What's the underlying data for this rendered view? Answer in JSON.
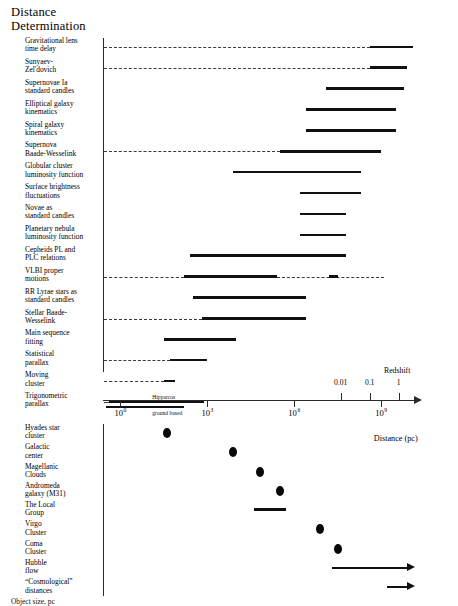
{
  "figure": {
    "title_line1": "Distance",
    "title_line2": "Determination",
    "bottom_caption": "Object size, pc"
  },
  "axes": {
    "distance": {
      "label": "Distance (pc)",
      "ticks": [
        {
          "mantissa": "10",
          "exponent": "0",
          "value": 0
        },
        {
          "mantissa": "10",
          "exponent": "3",
          "value": 3
        },
        {
          "mantissa": "10",
          "exponent": "6",
          "value": 6
        },
        {
          "mantissa": "10",
          "exponent": "9",
          "value": 9
        }
      ],
      "range_log10_pc": [
        -0.6,
        10.2
      ],
      "scale": "log"
    },
    "redshift": {
      "label": "Redshift",
      "ticks": [
        {
          "label": "0.01",
          "log10_pc": 7.6
        },
        {
          "label": "0.1",
          "log10_pc": 8.6
        },
        {
          "label": "1",
          "log10_pc": 9.6
        }
      ]
    }
  },
  "chart_data": {
    "type": "range-bar",
    "title": "Distance Determination",
    "xlabel": "Distance (pc)",
    "ylabel": "",
    "xscale": "log",
    "xlim_log10": [
      -0.6,
      10.2
    ],
    "secondary_axis": {
      "name": "Redshift",
      "ticks": [
        "0.01",
        "0.1",
        "1"
      ]
    },
    "methods": [
      {
        "label_lines": [
          "Gravitational lens",
          "time delay"
        ],
        "start_log10": 8.6,
        "end_log10": 10.1,
        "leader": true
      },
      {
        "label_lines": [
          "Sunyaev-",
          "Zel'dovich"
        ],
        "start_log10": 8.6,
        "end_log10": 9.9,
        "leader": true
      },
      {
        "label_lines": [
          "Supernovae Ia",
          "standard candles"
        ],
        "start_log10": 7.1,
        "end_log10": 9.8,
        "leader": false
      },
      {
        "label_lines": [
          "Elliptical galaxy",
          "kinematics"
        ],
        "start_log10": 6.4,
        "end_log10": 9.5,
        "leader": false
      },
      {
        "label_lines": [
          "Spiral galaxy",
          "kinematics"
        ],
        "start_log10": 6.4,
        "end_log10": 9.5,
        "leader": false
      },
      {
        "label_lines": [
          "Supernova",
          "Baade-Wesselink"
        ],
        "start_log10": 5.5,
        "end_log10": 9.0,
        "leader": true
      },
      {
        "label_lines": [
          "Globular cluster",
          "luminosity function"
        ],
        "start_log10": 3.9,
        "end_log10": 8.3,
        "leader": false
      },
      {
        "label_lines": [
          "Surface brightness",
          "fluctuations"
        ],
        "start_log10": 6.2,
        "end_log10": 8.3,
        "leader": false
      },
      {
        "label_lines": [
          "Novae as",
          "standard candles"
        ],
        "start_log10": 6.2,
        "end_log10": 7.8,
        "leader": false
      },
      {
        "label_lines": [
          "Planetary nebula",
          "luminosity function"
        ],
        "start_log10": 6.2,
        "end_log10": 7.8,
        "leader": false
      },
      {
        "label_lines": [
          "Cepheids PL and",
          "PLC relations"
        ],
        "start_log10": 2.4,
        "end_log10": 7.8,
        "leader": false
      },
      {
        "label_lines": [
          "VLBI proper",
          "motions"
        ],
        "start_log10": 2.2,
        "end_log10": 5.4,
        "leader": true,
        "extra_segments": [
          {
            "start_log10": 7.2,
            "end_log10": 7.5
          }
        ],
        "leader_extends_to_log10": 9.1
      },
      {
        "label_lines": [
          "RR Lyrae stars as",
          "standard candles"
        ],
        "start_log10": 2.5,
        "end_log10": 6.4,
        "leader": false
      },
      {
        "label_lines": [
          "Stellar Baade-",
          "Wesselink"
        ],
        "start_log10": 2.8,
        "end_log10": 6.4,
        "leader": true
      },
      {
        "label_lines": [
          "Main sequence",
          "fitting"
        ],
        "start_log10": 1.5,
        "end_log10": 4.0,
        "leader": false
      },
      {
        "label_lines": [
          "Statistical",
          "parallax"
        ],
        "start_log10": 1.7,
        "end_log10": 3.0,
        "leader": true
      },
      {
        "label_lines": [
          "Moving",
          "cluster"
        ],
        "start_log10": 1.5,
        "end_log10": 1.9,
        "leader": true
      },
      {
        "label_lines": [
          "Trigonometric",
          "parallax"
        ],
        "start_log10": -0.4,
        "end_log10": 2.9,
        "leader": true,
        "sub_captions": [
          {
            "text": "Hipparcos",
            "at_log10": 1.1,
            "row_offset": -7
          },
          {
            "text": "ground based",
            "at_log10": 1.1,
            "row_offset": 9
          }
        ],
        "second_bar": {
          "start_log10": -0.5,
          "end_log10": 2.2
        }
      }
    ],
    "objects": [
      {
        "label_lines": [
          "Hyades star",
          "cluster"
        ],
        "marker": "dot",
        "at_log10": 1.6
      },
      {
        "label_lines": [
          "Galactic",
          "center"
        ],
        "marker": "dot",
        "at_log10": 3.9
      },
      {
        "label_lines": [
          "Magellanic",
          "Clouds"
        ],
        "marker": "dot",
        "at_log10": 4.8
      },
      {
        "label_lines": [
          "Andromeda",
          "galaxy (M31)"
        ],
        "marker": "dot",
        "at_log10": 5.5
      },
      {
        "label_lines": [
          "The Local",
          "Group"
        ],
        "marker": "bar",
        "start_log10": 4.6,
        "end_log10": 5.7
      },
      {
        "label_lines": [
          "Virgo",
          "Cluster"
        ],
        "marker": "dot",
        "at_log10": 6.9
      },
      {
        "label_lines": [
          "Coma",
          "Cluster"
        ],
        "marker": "dot",
        "at_log10": 7.5
      },
      {
        "label_lines": [
          "Hubble",
          "flow"
        ],
        "marker": "arrow",
        "start_log10": 7.3,
        "end_log10": 10.1
      },
      {
        "label_lines": [
          "“Cosmological”",
          "distances"
        ],
        "marker": "arrow",
        "start_log10": 9.2,
        "end_log10": 10.1
      }
    ]
  }
}
